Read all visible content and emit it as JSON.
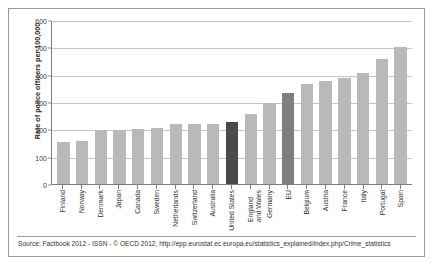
{
  "chart_data": {
    "type": "bar",
    "title": "",
    "xlabel": "",
    "ylabel": "Rate of police officers per 100,000",
    "ylim": [
      0,
      600
    ],
    "yticks": [
      600,
      500,
      400,
      300,
      200,
      100,
      0
    ],
    "grid": true,
    "legend": "none",
    "categories": [
      "Finland",
      "Norway",
      "Denmark",
      "Japan",
      "Canada",
      "Sweden",
      "Netherlands",
      "Switzerland",
      "Australia",
      "United States",
      "England\nand Wales",
      "Germany",
      "EU",
      "Belgium",
      "Austria",
      "France",
      "Italy",
      "Portugal",
      "Spain"
    ],
    "values": [
      155,
      158,
      198,
      199,
      200,
      205,
      218,
      218,
      221,
      226,
      257,
      298,
      333,
      365,
      378,
      388,
      405,
      456,
      500
    ],
    "highlights": {
      "United States": "dark",
      "EU": "medium"
    },
    "colors": {
      "bar": "#b9b9b9",
      "bar_dark": "#4a4a4a",
      "bar_medium": "#7f7f7f",
      "gridline": "#c4c4c4",
      "axis": "#7d7d7d",
      "frame": "#9a9a9a",
      "text": "#2f2f2f",
      "background": "#ffffff"
    }
  },
  "source": {
    "text": "Source: Factbook 2012 - ISSN  - © OECD 2012, http://epp.eurostat.ec.europa.eu/statistics_explained/index.php/Crime_statistics"
  }
}
